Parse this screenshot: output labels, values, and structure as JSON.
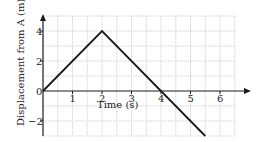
{
  "chart_data": {
    "type": "line",
    "title": "",
    "xlabel": "Time (s)",
    "ylabel": "Displacement from A (m)",
    "x_ticks": [
      "1",
      "2",
      "3",
      "4",
      "5",
      "6"
    ],
    "y_ticks": [
      "4",
      "2",
      "0",
      "−2"
    ],
    "xlim": [
      0,
      7
    ],
    "ylim": [
      -3,
      5
    ],
    "grid": true,
    "legend": null,
    "series": [
      {
        "name": "displacement",
        "x": [
          0,
          2,
          5.5
        ],
        "y": [
          0,
          4,
          -3
        ]
      }
    ]
  },
  "colors": {
    "line": "#1a1a1a",
    "grid": "#c8c8c8",
    "axis": "#1a1a1a"
  }
}
